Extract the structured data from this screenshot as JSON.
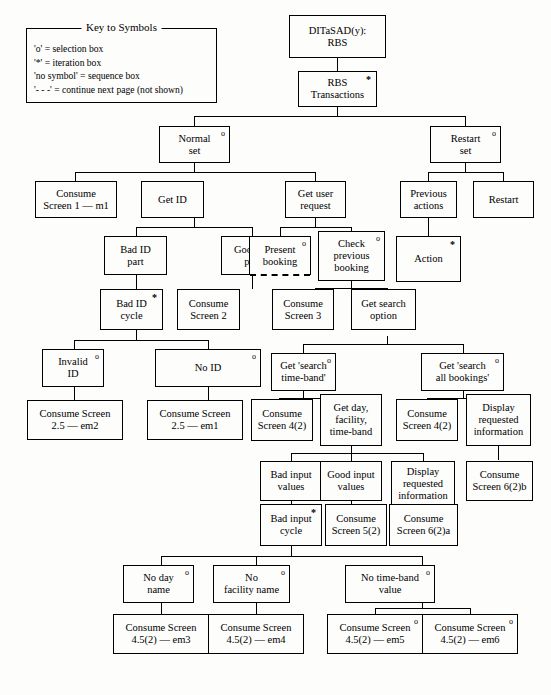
{
  "legend": {
    "title": "Key to Symbols",
    "entries": [
      "'o'  = selection box",
      " '*'  = iteration box",
      "'no symbol' = sequence box",
      "'- - -' = continue next page (not shown)"
    ]
  },
  "diagram": {
    "type": "tree",
    "nodes": [
      {
        "id": "root",
        "label": "DITaSAD(y):\nRBS",
        "marker": ""
      },
      {
        "id": "rbs_trans",
        "label": "RBS\nTransactions",
        "marker": "*"
      },
      {
        "id": "normal_set",
        "label": "Normal\nset",
        "marker": "o"
      },
      {
        "id": "restart_set",
        "label": "Restart\nset",
        "marker": "o"
      },
      {
        "id": "consume_s1",
        "label": "Consume\nScreen 1 — m1",
        "marker": ""
      },
      {
        "id": "get_id",
        "label": "Get ID",
        "marker": ""
      },
      {
        "id": "get_user_req",
        "label": "Get user\nrequest",
        "marker": ""
      },
      {
        "id": "prev_actions",
        "label": "Previous\nactions",
        "marker": ""
      },
      {
        "id": "restart",
        "label": "Restart",
        "marker": ""
      },
      {
        "id": "bad_id_part",
        "label": "Bad ID\npart",
        "marker": ""
      },
      {
        "id": "good_id_part",
        "label": "Good ID\npart",
        "marker": ""
      },
      {
        "id": "present_booking",
        "label": "Present\nbooking",
        "marker": "o",
        "continued": true
      },
      {
        "id": "check_prev_bk",
        "label": "Check\nprevious\nbooking",
        "marker": "o"
      },
      {
        "id": "action",
        "label": "Action",
        "marker": "*"
      },
      {
        "id": "bad_id_cycle",
        "label": "Bad ID\ncycle",
        "marker": "*"
      },
      {
        "id": "consume_s2",
        "label": "Consume\nScreen 2",
        "marker": ""
      },
      {
        "id": "consume_s3",
        "label": "Consume\nScreen 3",
        "marker": ""
      },
      {
        "id": "get_search_opt",
        "label": "Get search\noption",
        "marker": ""
      },
      {
        "id": "invalid_id",
        "label": "Invalid\nID",
        "marker": "o"
      },
      {
        "id": "no_id",
        "label": "No ID",
        "marker": "o"
      },
      {
        "id": "get_tb",
        "label": "Get 'search\ntime-band'",
        "marker": "o"
      },
      {
        "id": "get_all",
        "label": "Get 'search\nall bookings'",
        "marker": "o"
      },
      {
        "id": "cs_25_em2",
        "label": "Consume Screen\n2.5 — em2",
        "marker": ""
      },
      {
        "id": "cs_25_em1",
        "label": "Consume Screen\n2.5 — em1",
        "marker": ""
      },
      {
        "id": "cs_42_a",
        "label": "Consume\nScreen 4(2)",
        "marker": ""
      },
      {
        "id": "get_day",
        "label": "Get day,\nfacility,\ntime-band",
        "marker": ""
      },
      {
        "id": "cs_42_b",
        "label": "Consume\nScreen 4(2)",
        "marker": ""
      },
      {
        "id": "disp_req_1",
        "label": "Display\nrequested\ninformation",
        "marker": ""
      },
      {
        "id": "bad_input_vals",
        "label": "Bad input\nvalues",
        "marker": ""
      },
      {
        "id": "good_input_vals",
        "label": "Good input\nvalues",
        "marker": ""
      },
      {
        "id": "disp_req_2",
        "label": "Display\nrequested\ninformation",
        "marker": ""
      },
      {
        "id": "cs_62b",
        "label": "Consume\nScreen 6(2)b",
        "marker": ""
      },
      {
        "id": "bad_input_cycle",
        "label": "Bad input\ncycle",
        "marker": "*"
      },
      {
        "id": "cs_52",
        "label": "Consume\nScreen 5(2)",
        "marker": ""
      },
      {
        "id": "cs_62a",
        "label": "Consume\nScreen 6(2)a",
        "marker": ""
      },
      {
        "id": "no_day_name",
        "label": "No day\nname",
        "marker": "o"
      },
      {
        "id": "no_fac_name",
        "label": "No\nfacility name",
        "marker": "o"
      },
      {
        "id": "no_tb_value",
        "label": "No time-band\nvalue",
        "marker": "o"
      },
      {
        "id": "cs_452_em3",
        "label": "Consume Screen\n4.5(2) — em3",
        "marker": ""
      },
      {
        "id": "cs_452_em4",
        "label": "Consume Screen\n4.5(2) — em4",
        "marker": ""
      },
      {
        "id": "cs_452_em5",
        "label": "Consume Screen\n4.5(2) — em5",
        "marker": "o"
      },
      {
        "id": "cs_452_em6",
        "label": "Consume Screen\n4.5(2) — em6",
        "marker": "o"
      }
    ],
    "edges": [
      [
        "root",
        "rbs_trans"
      ],
      [
        "rbs_trans",
        "normal_set"
      ],
      [
        "rbs_trans",
        "restart_set"
      ],
      [
        "normal_set",
        "consume_s1"
      ],
      [
        "normal_set",
        "get_id"
      ],
      [
        "normal_set",
        "get_user_req"
      ],
      [
        "restart_set",
        "prev_actions"
      ],
      [
        "restart_set",
        "restart"
      ],
      [
        "get_id",
        "bad_id_part"
      ],
      [
        "get_id",
        "good_id_part"
      ],
      [
        "get_user_req",
        "present_booking"
      ],
      [
        "get_user_req",
        "check_prev_bk"
      ],
      [
        "prev_actions",
        "action"
      ],
      [
        "bad_id_part",
        "bad_id_cycle"
      ],
      [
        "good_id_part",
        "consume_s2"
      ],
      [
        "check_prev_bk",
        "consume_s3"
      ],
      [
        "check_prev_bk",
        "get_search_opt"
      ],
      [
        "bad_id_cycle",
        "invalid_id"
      ],
      [
        "bad_id_cycle",
        "no_id"
      ],
      [
        "get_search_opt",
        "get_tb"
      ],
      [
        "get_search_opt",
        "get_all"
      ],
      [
        "invalid_id",
        "cs_25_em2"
      ],
      [
        "no_id",
        "cs_25_em1"
      ],
      [
        "get_tb",
        "cs_42_a"
      ],
      [
        "get_tb",
        "get_day"
      ],
      [
        "get_all",
        "cs_42_b"
      ],
      [
        "get_all",
        "disp_req_1"
      ],
      [
        "get_day",
        "bad_input_vals"
      ],
      [
        "get_day",
        "good_input_vals"
      ],
      [
        "get_day",
        "disp_req_2"
      ],
      [
        "disp_req_1",
        "cs_62b"
      ],
      [
        "bad_input_vals",
        "bad_input_cycle"
      ],
      [
        "good_input_vals",
        "cs_52"
      ],
      [
        "disp_req_2",
        "cs_62a"
      ],
      [
        "bad_input_cycle",
        "no_day_name"
      ],
      [
        "bad_input_cycle",
        "no_fac_name"
      ],
      [
        "bad_input_cycle",
        "no_tb_value"
      ],
      [
        "no_day_name",
        "cs_452_em3"
      ],
      [
        "no_fac_name",
        "cs_452_em4"
      ],
      [
        "no_tb_value",
        "cs_452_em5"
      ],
      [
        "no_tb_value",
        "cs_452_em6"
      ]
    ]
  }
}
